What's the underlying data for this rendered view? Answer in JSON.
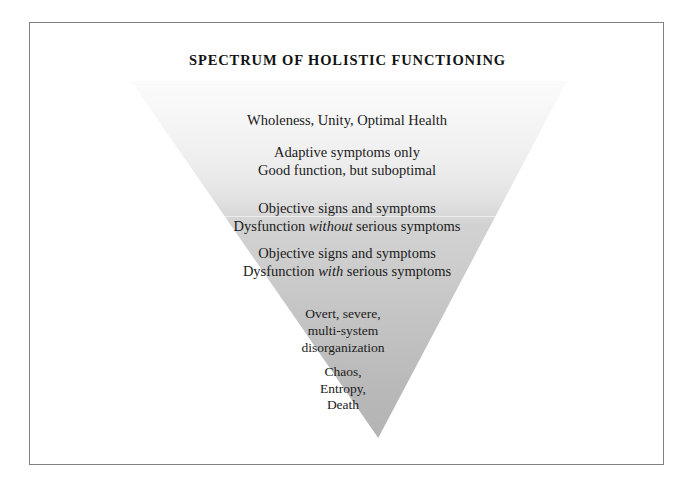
{
  "figure": {
    "title": "SPECTRUM OF HOLISTIC FUNCTIONING",
    "shape": "inverted-triangle",
    "gradient": {
      "top_color": "#fbfbfb",
      "bottom_color": "#b4b4b4",
      "direction": "top-to-bottom light-to-dark"
    },
    "text_color": "#1b1b1b",
    "frame_color": "#808080",
    "background_color": "#ffffff"
  },
  "tiers": [
    {
      "index": 1,
      "lines": [
        "Wholeness, Unity, Optimal Health"
      ]
    },
    {
      "index": 2,
      "lines": [
        "Adaptive symptoms only",
        "Good function, but suboptimal"
      ]
    },
    {
      "index": 3,
      "lines_parts": {
        "line1": "Objective signs and symptoms",
        "line2_pre": "Dysfunction ",
        "line2_emph": "without",
        "line2_post": " serious symptoms"
      }
    },
    {
      "index": 4,
      "lines_parts": {
        "line1": "Objective signs and symptoms",
        "line2_pre": "Dysfunction ",
        "line2_emph": "with",
        "line2_post": " serious symptoms"
      }
    },
    {
      "index": 5,
      "lines": [
        "Overt, severe,",
        "multi-system",
        "disorganization"
      ]
    },
    {
      "index": 6,
      "lines": [
        "Chaos,",
        "Entropy,",
        "Death"
      ]
    }
  ]
}
